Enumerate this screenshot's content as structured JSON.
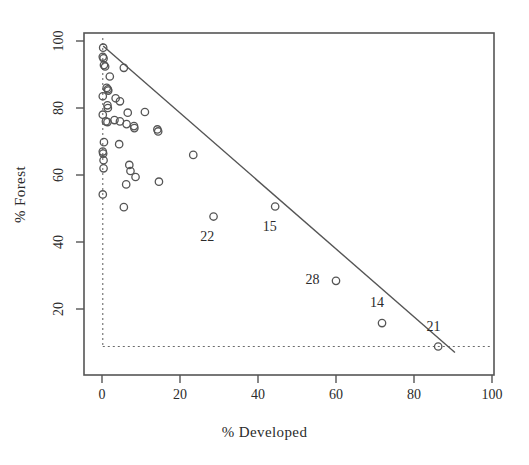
{
  "chart_data": {
    "type": "scatter",
    "title": "",
    "xlabel": "% Developed",
    "ylabel": "% Forest",
    "xlim": [
      0,
      100
    ],
    "ylim": [
      4,
      104
    ],
    "xticks": [
      0,
      20,
      40,
      60,
      80,
      100
    ],
    "yticks": [
      20,
      40,
      60,
      80,
      100
    ],
    "grid": false,
    "legend": null,
    "marker": "open-circle",
    "marker_color": "#555555",
    "frame_color": "#555555",
    "points": [
      {
        "x": 0.3,
        "y": 98.0
      },
      {
        "x": 0.2,
        "y": 95.3
      },
      {
        "x": 0.4,
        "y": 94.8
      },
      {
        "x": 0.5,
        "y": 92.8
      },
      {
        "x": 0.8,
        "y": 92.4
      },
      {
        "x": 5.6,
        "y": 92.0
      },
      {
        "x": 2.0,
        "y": 89.4
      },
      {
        "x": 1.2,
        "y": 86.0
      },
      {
        "x": 1.5,
        "y": 85.6
      },
      {
        "x": 1.6,
        "y": 85.2
      },
      {
        "x": 0.2,
        "y": 83.5
      },
      {
        "x": 3.5,
        "y": 82.9
      },
      {
        "x": 4.6,
        "y": 82.0
      },
      {
        "x": 1.4,
        "y": 80.8
      },
      {
        "x": 1.5,
        "y": 80.0
      },
      {
        "x": 0.2,
        "y": 78.0
      },
      {
        "x": 6.6,
        "y": 78.6
      },
      {
        "x": 11.0,
        "y": 78.8
      },
      {
        "x": 1.0,
        "y": 76.0
      },
      {
        "x": 1.4,
        "y": 75.8
      },
      {
        "x": 3.2,
        "y": 76.4
      },
      {
        "x": 4.6,
        "y": 76.0
      },
      {
        "x": 6.3,
        "y": 75.2
      },
      {
        "x": 8.2,
        "y": 74.6
      },
      {
        "x": 8.3,
        "y": 74.0
      },
      {
        "x": 14.2,
        "y": 73.6
      },
      {
        "x": 14.4,
        "y": 73.0
      },
      {
        "x": 0.5,
        "y": 69.8
      },
      {
        "x": 4.4,
        "y": 69.2
      },
      {
        "x": 0.2,
        "y": 67.0
      },
      {
        "x": 0.3,
        "y": 66.4
      },
      {
        "x": 23.4,
        "y": 66.0
      },
      {
        "x": 0.4,
        "y": 64.4
      },
      {
        "x": 0.4,
        "y": 62.0
      },
      {
        "x": 7.0,
        "y": 63.0
      },
      {
        "x": 7.3,
        "y": 61.2
      },
      {
        "x": 8.6,
        "y": 59.4
      },
      {
        "x": 14.6,
        "y": 58.0
      },
      {
        "x": 6.2,
        "y": 57.2
      },
      {
        "x": 0.2,
        "y": 54.2
      },
      {
        "x": 5.6,
        "y": 50.4
      },
      {
        "x": 28.6,
        "y": 47.6
      },
      {
        "x": 44.4,
        "y": 50.6
      },
      {
        "x": 60.0,
        "y": 28.4
      },
      {
        "x": 71.8,
        "y": 15.8
      },
      {
        "x": 86.2,
        "y": 8.8
      }
    ],
    "labeled_points": [
      {
        "label": "22",
        "x": 28.6,
        "y": 47.6,
        "label_x": 27.0,
        "label_y": 41.5
      },
      {
        "label": "15",
        "x": 44.4,
        "y": 50.6,
        "label_x": 43.0,
        "label_y": 44.5
      },
      {
        "label": "28",
        "x": 60.0,
        "y": 28.4,
        "label_x": 54.0,
        "label_y": 28.8
      },
      {
        "label": "14",
        "x": 71.8,
        "y": 15.8,
        "label_x": 70.5,
        "label_y": 21.8
      },
      {
        "label": "21",
        "x": 86.2,
        "y": 8.8,
        "label_x": 85.0,
        "label_y": 14.6
      }
    ],
    "reference_line": {
      "description": "solid boundary line",
      "from": {
        "x": 0.3,
        "y": 98.5
      },
      "to": {
        "x": 90.5,
        "y": 7.0
      },
      "style": "solid",
      "color": "#555555"
    },
    "dashed_lines": [
      {
        "description": "vertical dashed at x minimum",
        "orientation": "vertical",
        "value": 0.2,
        "style": "dotted",
        "color": "#6a6a6a"
      },
      {
        "description": "horizontal dashed at y minimum",
        "orientation": "horizontal",
        "value": 8.8,
        "style": "dotted",
        "color": "#6a6a6a"
      }
    ]
  }
}
